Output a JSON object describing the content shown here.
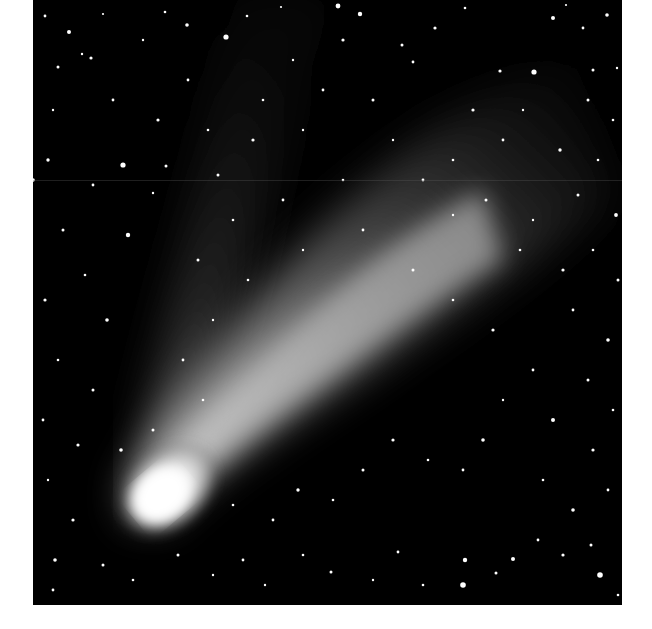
{
  "image": {
    "subject": "Comet with bright nucleus and dual tails against a star field",
    "alt": "Black-and-white astrophotograph of a comet: bright coma at lower-left, broad dust tail fanning up to the upper-right, and a fainter narrow ion tail extending toward the top, surrounded by numerous stars",
    "palette": {
      "sky": "#000000",
      "coma": "#ffffff",
      "tail": "#9a9a9a",
      "background": "#ffffff"
    }
  }
}
